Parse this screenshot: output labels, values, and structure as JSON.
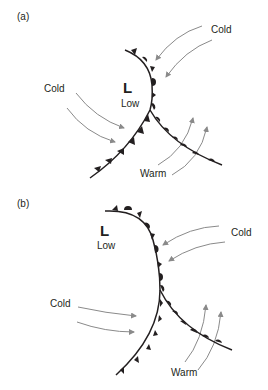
{
  "panels": [
    {
      "id": "a",
      "label": "(a)",
      "low_symbol": "L",
      "low_text": "Low",
      "cold_left": "Cold",
      "cold_right": "Cold",
      "warm": "Warm"
    },
    {
      "id": "b",
      "label": "(b)",
      "low_symbol": "L",
      "low_text": "Low",
      "cold_left": "Cold",
      "cold_right": "Cold",
      "warm": "Warm"
    }
  ],
  "colors": {
    "front": "#231f20",
    "arrow": "#8a8a8a",
    "text": "#231f20"
  }
}
